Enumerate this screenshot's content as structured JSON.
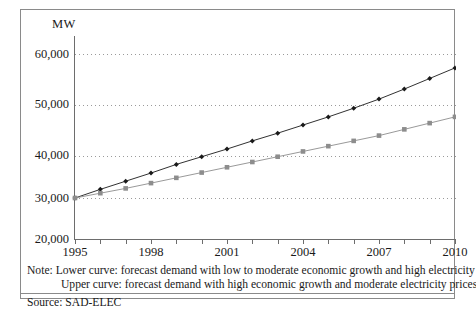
{
  "figure": {
    "y_axis_title": "MW",
    "note_label": "Note:",
    "note_lines": [
      "Note: Lower curve: forecast demand with low to moderate economic growth and high electricity prices",
      "Upper curve: forecast demand with high economic growth and moderate electricity prices"
    ],
    "source": "Source: SAD-ELEC",
    "colors": {
      "upper_curve": "#1a1a1a",
      "lower_curve": "#8d8d8d",
      "grid": "#9a9a9a",
      "axis": "#6d6d6d",
      "frame": "#8a8a8a"
    }
  },
  "chart_data": {
    "type": "line",
    "title": "",
    "xlabel": "",
    "ylabel": "MW",
    "xlim": [
      1995,
      2010
    ],
    "ylim": [
      20000,
      60000
    ],
    "ytick_labels": [
      "60,000",
      "50,000",
      "40,000",
      "30,000",
      "20,000"
    ],
    "yticks": [
      60000,
      50000,
      40000,
      30000,
      20000
    ],
    "xticks": [
      1995,
      1996,
      1997,
      1998,
      1999,
      2000,
      2001,
      2002,
      2003,
      2004,
      2005,
      2006,
      2007,
      2008,
      2009,
      2010
    ],
    "xtick_labels_shown": [
      "1995",
      "1998",
      "2001",
      "2004",
      "2007",
      "2010"
    ],
    "grid": true,
    "legend": "none",
    "x": [
      1995,
      1996,
      1997,
      1998,
      1999,
      2000,
      2001,
      2002,
      2003,
      2004,
      2005,
      2006,
      2007,
      2008,
      2009,
      2010
    ],
    "series": [
      {
        "name": "Upper curve: forecast demand with high economic growth and moderate electricity prices",
        "marker": "diamond",
        "color": "#1a1a1a",
        "values": [
          30000,
          31800,
          33500,
          35200,
          37000,
          38600,
          40200,
          41900,
          43500,
          45200,
          46900,
          48700,
          50600,
          52700,
          54900,
          57100
        ]
      },
      {
        "name": "Lower curve: forecast demand with low to moderate economic growth and high electricity prices",
        "marker": "square",
        "color": "#8d8d8d",
        "values": [
          30000,
          31000,
          32000,
          33100,
          34200,
          35300,
          36400,
          37500,
          38600,
          39700,
          40800,
          41900,
          43000,
          44300,
          45600,
          46900
        ]
      }
    ]
  }
}
